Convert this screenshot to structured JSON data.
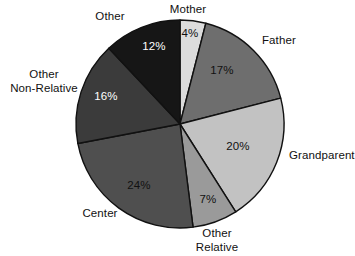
{
  "chart_data": {
    "type": "pie",
    "title": "",
    "subtitle": "",
    "xlabel": "",
    "ylabel": "",
    "legend_position": "none",
    "grid": false,
    "units": "percent",
    "total": 100,
    "start_angle_deg": 0,
    "direction": "clockwise",
    "categories": [
      "Mother",
      "Father",
      "Grandparent",
      "Other Relative",
      "Center",
      "Other Non-Relative",
      "Other"
    ],
    "values": [
      4,
      17,
      20,
      7,
      24,
      16,
      12
    ],
    "value_labels": [
      "4%",
      "17%",
      "20%",
      "7%",
      "24%",
      "16%",
      "12%"
    ],
    "slices": [
      {
        "label": "Mother",
        "label_line1": "Mother",
        "label_line2": "",
        "value": 4,
        "value_label": "4%",
        "color": "#dcdcdc",
        "text_color": "#111111"
      },
      {
        "label": "Father",
        "label_line1": "Father",
        "label_line2": "",
        "value": 17,
        "value_label": "17%",
        "color": "#6e6e6e",
        "text_color": "#111111"
      },
      {
        "label": "Grandparent",
        "label_line1": "Grandparent",
        "label_line2": "",
        "value": 20,
        "value_label": "20%",
        "color": "#c2c2c2",
        "text_color": "#111111"
      },
      {
        "label": "Other Relative",
        "label_line1": "Other",
        "label_line2": "Relative",
        "value": 7,
        "value_label": "7%",
        "color": "#9a9a9a",
        "text_color": "#111111"
      },
      {
        "label": "Center",
        "label_line1": "Center",
        "label_line2": "",
        "value": 24,
        "value_label": "24%",
        "color": "#4f4f4f",
        "text_color": "#111111"
      },
      {
        "label": "Other Non-Relative",
        "label_line1": "Other",
        "label_line2": "Non-Relative",
        "value": 16,
        "value_label": "16%",
        "color": "#3b3b3b",
        "text_color": "#ffffff"
      },
      {
        "label": "Other",
        "label_line1": "Other",
        "label_line2": "",
        "value": 12,
        "value_label": "12%",
        "color": "#161616",
        "text_color": "#ffffff"
      }
    ],
    "colors": {
      "outline": "#111111",
      "background": "#ffffff",
      "text": "#111111",
      "text_on_dark": "#ffffff"
    },
    "geometry": {
      "center_x": 180,
      "center_y": 124,
      "radius": 104
    },
    "category_label_positions": [
      {
        "label": "Mother",
        "x": 188,
        "y": 13,
        "anchor": "middle"
      },
      {
        "label": "Father",
        "x": 262,
        "y": 44,
        "anchor": "start"
      },
      {
        "label": "Grandparent",
        "x": 289,
        "y": 159,
        "anchor": "start"
      },
      {
        "label": "Other Relative",
        "x": 217,
        "y": 237,
        "anchor": "middle"
      },
      {
        "label": "Center",
        "x": 100,
        "y": 217,
        "anchor": "middle"
      },
      {
        "label": "Other Non-Relative",
        "x": 44,
        "y": 78,
        "anchor": "middle"
      },
      {
        "label": "Other",
        "x": 110,
        "y": 20,
        "anchor": "middle"
      }
    ],
    "value_label_positions": [
      {
        "label": "Mother",
        "x": 190,
        "y": 37
      },
      {
        "label": "Father",
        "x": 222,
        "y": 74
      },
      {
        "label": "Grandparent",
        "x": 238,
        "y": 150
      },
      {
        "label": "Other Relative",
        "x": 208,
        "y": 203
      },
      {
        "label": "Center",
        "x": 139,
        "y": 189
      },
      {
        "label": "Other Non-Relative",
        "x": 106,
        "y": 100
      },
      {
        "label": "Other",
        "x": 154,
        "y": 50
      }
    ]
  }
}
